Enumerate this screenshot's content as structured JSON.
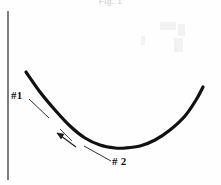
{
  "figure": {
    "caption": "Fig. 1",
    "background_color": "#fefefe",
    "ink_color": "#111111",
    "axis": {
      "name": "vertical-axis",
      "x": 8,
      "y_top": 11,
      "y_bottom": 180,
      "stroke_width": 1.3,
      "color": "#3a3a3a"
    },
    "callouts": [
      {
        "label": "#1",
        "label_x": 11,
        "label_y": 89,
        "leader_from": [
          29,
          99
        ],
        "leader_to": [
          49,
          118
        ]
      },
      {
        "label": "# 2",
        "label_x": 112,
        "label_y": 155,
        "leader_from": [
          111,
          161
        ],
        "leader_to": [
          84,
          146
        ]
      }
    ],
    "marker": {
      "name": "tangent-arrow-marker",
      "from": [
        75,
        146
      ],
      "to": [
        56,
        132
      ],
      "note": "small arrow touching the curve"
    }
  },
  "chart_data": {
    "type": "line",
    "title": "Fig. 1",
    "xlabel": "",
    "ylabel": "",
    "grid": false,
    "legend": null,
    "axis_style": "single vertical axis on left, no ticks, no tick labels",
    "series": [
      {
        "name": "u-shaped-curve",
        "stroke": "#111111",
        "stroke_width": 3.2,
        "x": [
          26,
          40,
          55,
          70,
          85,
          100,
          115,
          125,
          140,
          155,
          170,
          185,
          196,
          203
        ],
        "y": [
          72,
          92,
          110,
          126,
          138,
          145,
          148,
          148,
          146,
          140,
          130,
          116,
          100,
          87
        ]
      }
    ],
    "annotations": [
      {
        "text": "#1",
        "x": 11,
        "y": 89,
        "points_to": [
          49,
          118
        ]
      },
      {
        "text": "# 2",
        "x": 112,
        "y": 155,
        "points_to": [
          84,
          146
        ]
      }
    ],
    "xlim": [
      8,
      221
    ],
    "ylim": [
      180,
      11
    ]
  }
}
